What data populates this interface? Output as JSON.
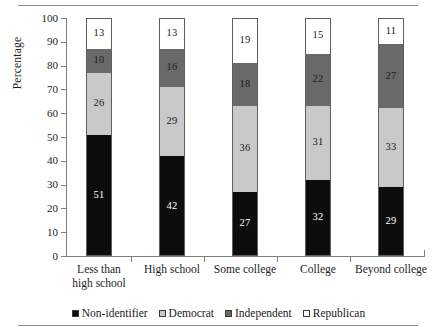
{
  "chart_data": {
    "type": "bar",
    "subtype": "stacked-bar-100",
    "title": "",
    "xlabel": "",
    "ylabel": "Percentage",
    "ylim": [
      0,
      100
    ],
    "yticks": [
      0,
      10,
      20,
      30,
      40,
      50,
      60,
      70,
      80,
      90,
      100
    ],
    "grid": false,
    "legend_position": "bottom",
    "categories": [
      "Less than high school",
      "High school",
      "Some college",
      "College",
      "Beyond college"
    ],
    "category_lines": [
      [
        "Less than",
        "high school"
      ],
      [
        "High school"
      ],
      [
        "Some college"
      ],
      [
        "College"
      ],
      [
        "Beyond college"
      ]
    ],
    "series": [
      {
        "name": "Non-identifier",
        "color": "#0d0d0d",
        "label_on_dark": true,
        "values": [
          51,
          42,
          27,
          32,
          29
        ]
      },
      {
        "name": "Democrat",
        "color": "#c9c9c9",
        "label_on_dark": false,
        "values": [
          26,
          29,
          36,
          31,
          33
        ]
      },
      {
        "name": "Independent",
        "color": "#696969",
        "label_on_dark": false,
        "values": [
          10,
          16,
          18,
          22,
          27
        ]
      },
      {
        "name": "Republican",
        "color": "#ffffff",
        "label_on_dark": false,
        "values": [
          13,
          13,
          19,
          15,
          11
        ]
      }
    ],
    "legend": [
      {
        "label": "Non-identifier",
        "color": "#0d0d0d"
      },
      {
        "label": "Democrat",
        "color": "#c9c9c9"
      },
      {
        "label": "Independent",
        "color": "#696969"
      },
      {
        "label": "Republican",
        "color": "#ffffff"
      }
    ]
  }
}
